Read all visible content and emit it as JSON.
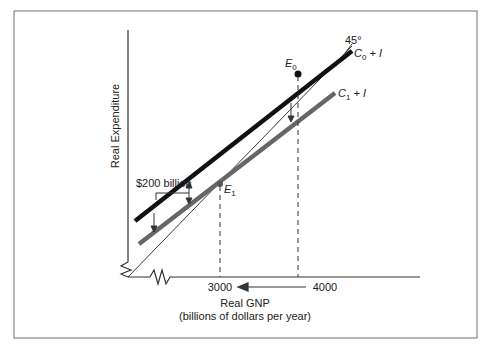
{
  "figure": {
    "y_axis_label": "Real Expenditure",
    "x_axis_label": "Real GNP",
    "x_axis_sublabel": "(billions of dollars per year)",
    "x_ticks": [
      "3000",
      "4000"
    ],
    "line_45_label": "45°",
    "line_c0_label_main": "C",
    "line_c0_label_sub": "0",
    "line_c0_label_rest": " + I",
    "line_c1_label_main": "C",
    "line_c1_label_sub": "1",
    "line_c1_label_rest": " + I",
    "e0_label_main": "E",
    "e0_label_sub": "0",
    "e1_label_main": "E",
    "e1_label_sub": "1",
    "shift_label": "$200 billion"
  },
  "colors": {
    "frame": "#888888",
    "axis": "#333333",
    "c0_line": "#111111",
    "c1_line": "#666666",
    "line_45": "#222222"
  }
}
